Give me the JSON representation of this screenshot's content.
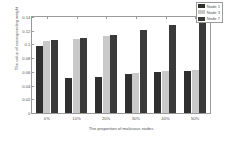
{
  "chart_data": {
    "type": "bar",
    "title": "",
    "xlabel": "The proportion of malicious nodes",
    "ylabel": "The value of corresponding weight",
    "categories": [
      "0%",
      "10%",
      "20%",
      "30%",
      "40%",
      "50%"
    ],
    "series": [
      {
        "name": "Node 1",
        "color": "#2f2f2f",
        "values": [
          0.098,
          0.051,
          0.053,
          0.057,
          0.06,
          0.062
        ]
      },
      {
        "name": "Node 3",
        "color": "#c9c9c9",
        "values": [
          0.105,
          0.108,
          0.113,
          0.058,
          0.061,
          0.063
        ]
      },
      {
        "name": "Node 7",
        "color": "#3a3a3a",
        "values": [
          0.106,
          0.11,
          0.114,
          0.121,
          0.128,
          0.133
        ]
      }
    ],
    "ylim": [
      0,
      0.14
    ],
    "yticks": [
      "0",
      "0.02",
      "0.04",
      "0.06",
      "0.08",
      "0.1",
      "0.12",
      "0.14"
    ],
    "ytick_values": [
      0,
      0.02,
      0.04,
      0.06,
      0.08,
      0.1,
      0.12,
      0.14
    ],
    "grid": false,
    "legend_position": "top-right"
  }
}
